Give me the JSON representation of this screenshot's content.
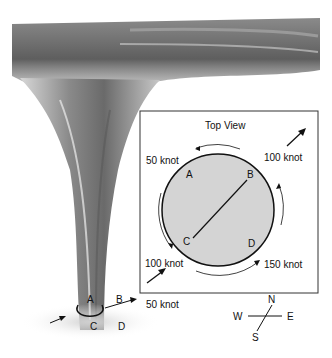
{
  "diagram": {
    "topview": {
      "title": "Top View",
      "points": {
        "a": "A",
        "b": "B",
        "c": "C",
        "d": "D"
      },
      "speeds": {
        "nw": "50 knot",
        "ne": "100 knot",
        "sw": "100 knot",
        "se": "150 knot"
      }
    },
    "ground": {
      "points": {
        "a": "A",
        "b": "B",
        "c": "C",
        "d": "D"
      },
      "speed": "50 knot"
    },
    "compass": {
      "n": "N",
      "s": "S",
      "e": "E",
      "w": "W"
    },
    "colors": {
      "box_border": "#333333",
      "disc_fill": "#d4d4d4",
      "funnel": "#6e6e6e"
    }
  }
}
